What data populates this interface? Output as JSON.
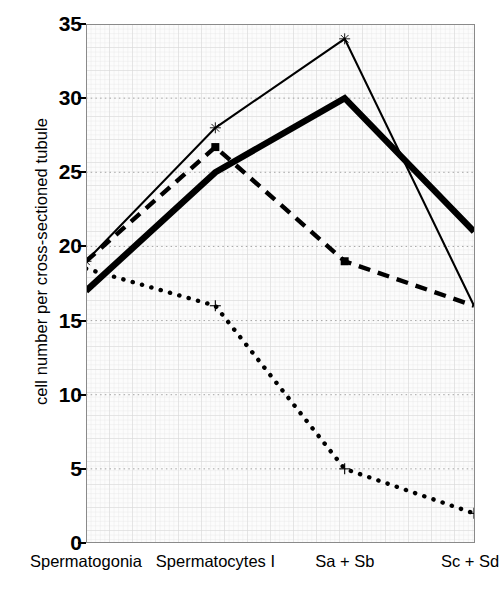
{
  "chart_data": {
    "type": "line",
    "title": "",
    "xlabel": "",
    "ylabel": "cell number per cross-sectioned tubule",
    "categories": [
      "Spermatogonia",
      "Spermatocytes I",
      "Sa + Sb",
      "Sc + Sd"
    ],
    "ylim": [
      0,
      35
    ],
    "yticks": [
      0,
      5,
      10,
      15,
      20,
      25,
      30,
      35
    ],
    "ytick_labels": [
      "0",
      "5",
      "10",
      "15",
      "20",
      "25",
      "30",
      "35"
    ],
    "grid": true,
    "grid_style": "fine light grid with dotted major horizontal gridlines",
    "legend": "none",
    "series": [
      {
        "name": "thin-solid-x",
        "style": "thin solid line with star/x markers",
        "color": "#000000",
        "values": [
          19,
          28,
          34,
          16
        ]
      },
      {
        "name": "thick-solid",
        "style": "thick solid line, no markers",
        "color": "#000000",
        "values": [
          17,
          25,
          30,
          21
        ]
      },
      {
        "name": "dashed-square",
        "style": "dashed line with filled square markers",
        "color": "#000000",
        "values": [
          19,
          26.7,
          19,
          16
        ]
      },
      {
        "name": "dotted-plus",
        "style": "dotted line with plus markers",
        "color": "#000000",
        "values": [
          18.5,
          16,
          5,
          2
        ]
      }
    ]
  },
  "axis": {
    "ylabel_text": "cell number per cross-sectioned tubule"
  }
}
